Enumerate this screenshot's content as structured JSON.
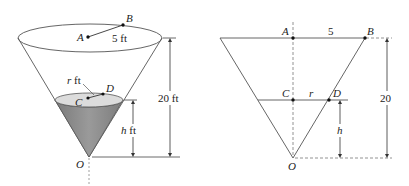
{
  "left_figure": {
    "point_A": "A",
    "point_B": "B",
    "point_C": "C",
    "point_D": "D",
    "point_O": "O",
    "radius_top": "5 ft",
    "radius_water_var": "r",
    "radius_water_unit": " ft",
    "height_total": "20 ft",
    "height_water_var": "h",
    "height_water_unit": " ft"
  },
  "right_figure": {
    "point_A": "A",
    "point_B": "B",
    "point_C": "C",
    "point_D": "D",
    "point_O": "O",
    "radius_top": "5",
    "radius_water": "r",
    "height_total": "20",
    "height_water": "h"
  },
  "colors": {
    "line": "#444444",
    "water_fill": "#8c8c8c",
    "water_surface": "#d9d9d9"
  }
}
